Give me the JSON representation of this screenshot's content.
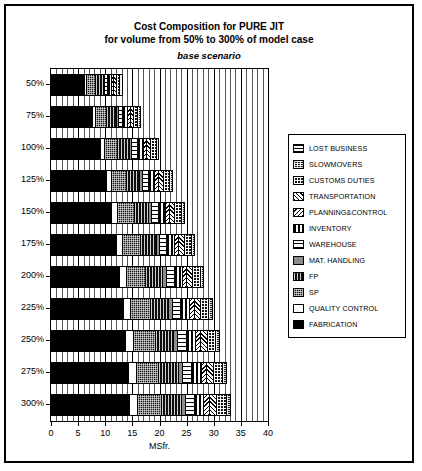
{
  "chart": {
    "title_line1": "Cost Composition for PURE JIT",
    "title_line2": "for volume from 50% to 300% of model case",
    "subtitle": "base scenario"
  },
  "chart_data": {
    "type": "bar",
    "orientation": "horizontal",
    "stacked": true,
    "title": "Cost Composition for PURE JIT for volume from 50% to 300% of model case",
    "subtitle": "base scenario",
    "xlabel": "MSfr.",
    "ylabel": "",
    "xlim": [
      0,
      40
    ],
    "xticks": [
      0,
      5,
      10,
      15,
      20,
      25,
      30,
      35,
      40
    ],
    "grid": true,
    "legend_position": "right",
    "categories": [
      "50%",
      "75%",
      "100%",
      "125%",
      "150%",
      "175%",
      "200%",
      "225%",
      "250%",
      "275%",
      "300%"
    ],
    "series": [
      {
        "name": "FABRICATION",
        "key": "fabrication",
        "values": [
          6.2,
          7.7,
          9.2,
          10.3,
          11.3,
          12.1,
          12.8,
          13.4,
          13.9,
          14.3,
          14.6
        ]
      },
      {
        "name": "QUALITY CONTROL",
        "key": "qualitycontrol",
        "values": [
          0.5,
          0.6,
          0.8,
          0.9,
          1.0,
          1.1,
          1.2,
          1.3,
          1.4,
          1.5,
          1.5
        ]
      },
      {
        "name": "SP",
        "key": "sp",
        "values": [
          1.6,
          2.0,
          2.4,
          2.8,
          3.1,
          3.4,
          3.6,
          3.8,
          4.0,
          4.2,
          4.3
        ]
      },
      {
        "name": "FP",
        "key": "fp",
        "values": [
          1.4,
          1.8,
          2.1,
          2.4,
          2.7,
          2.9,
          3.1,
          3.3,
          3.4,
          3.6,
          3.7
        ]
      },
      {
        "name": "MAT. HANDLING",
        "key": "mathandling",
        "values": [
          0.3,
          0.4,
          0.5,
          0.5,
          0.6,
          0.6,
          0.7,
          0.7,
          0.8,
          0.8,
          0.8
        ]
      },
      {
        "name": "WAREHOUSE",
        "key": "warehouse",
        "values": [
          0.6,
          0.8,
          1.0,
          1.1,
          1.2,
          1.3,
          1.4,
          1.5,
          1.5,
          1.6,
          1.6
        ]
      },
      {
        "name": "INVENTORY",
        "key": "inventory",
        "values": [
          0.7,
          0.9,
          1.1,
          1.2,
          1.3,
          1.4,
          1.5,
          1.6,
          1.7,
          1.8,
          1.8
        ]
      },
      {
        "name": "PLANNING&CONTROL",
        "key": "planningcontrol",
        "values": [
          0.4,
          0.5,
          0.6,
          0.7,
          0.7,
          0.8,
          0.8,
          0.9,
          0.9,
          1.0,
          1.0
        ]
      },
      {
        "name": "TRANSPORTATION",
        "key": "transportation",
        "values": [
          0.5,
          0.6,
          0.8,
          0.9,
          1.0,
          1.1,
          1.1,
          1.2,
          1.3,
          1.3,
          1.4
        ]
      },
      {
        "name": "CUSTOMS DUTIES",
        "key": "customsduties",
        "values": [
          0.6,
          0.8,
          1.0,
          1.1,
          1.2,
          1.3,
          1.4,
          1.5,
          1.6,
          1.6,
          1.7
        ]
      },
      {
        "name": "SLOWMOVERS",
        "key": "slowmovers",
        "values": [
          0.2,
          0.3,
          0.3,
          0.4,
          0.4,
          0.4,
          0.5,
          0.5,
          0.5,
          0.5,
          0.6
        ]
      },
      {
        "name": "LOST BUSINESS",
        "key": "lostbusiness",
        "values": [
          0.0,
          0.0,
          0.0,
          0.0,
          0.0,
          0.0,
          0.0,
          0.0,
          0.0,
          0.0,
          0.0
        ]
      }
    ],
    "totals": [
      13.0,
      16.4,
      19.8,
      22.3,
      24.5,
      26.4,
      28.1,
      29.7,
      31.0,
      32.2,
      33.0
    ]
  },
  "legend": {
    "items": [
      {
        "label": "LOST BUSINESS",
        "key": "lostbusiness"
      },
      {
        "label": "SLOWMOVERS",
        "key": "slowmovers"
      },
      {
        "label": "CUSTOMS DUTIES",
        "key": "customsduties"
      },
      {
        "label": "TRANSPORTATION",
        "key": "transportation"
      },
      {
        "label": "PLANNING&CONTROL",
        "key": "planningcontrol"
      },
      {
        "label": "INVENTORY",
        "key": "inventory"
      },
      {
        "label": "WAREHOUSE",
        "key": "warehouse"
      },
      {
        "label": "MAT. HANDLING",
        "key": "mathandling"
      },
      {
        "label": "FP",
        "key": "fp"
      },
      {
        "label": "SP",
        "key": "sp"
      },
      {
        "label": "QUALITY CONTROL",
        "key": "qualitycontrol"
      },
      {
        "label": "FABRICATION",
        "key": "fabrication"
      }
    ]
  }
}
